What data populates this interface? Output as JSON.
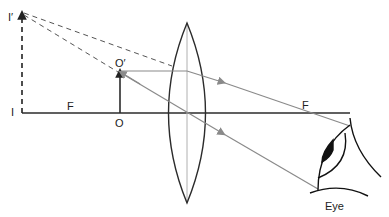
{
  "diagram": {
    "labels": {
      "image_top": "I′",
      "image_base": "I",
      "focus_left": "F",
      "object_base": "O",
      "object_top": "O′",
      "focus_right": "F",
      "eye": "Eye"
    },
    "colors": {
      "axis": "#2b2b2b",
      "lens": "#2b2b2b",
      "ray": "#8a8a8a",
      "virtual_ray": "#555555",
      "lens_axis": "#b0b0b0",
      "object": "#2b2b2b"
    },
    "elements": [
      "principal-axis",
      "convex-lens",
      "object-arrow",
      "virtual-image-arrow",
      "refracted-rays",
      "eye"
    ]
  }
}
